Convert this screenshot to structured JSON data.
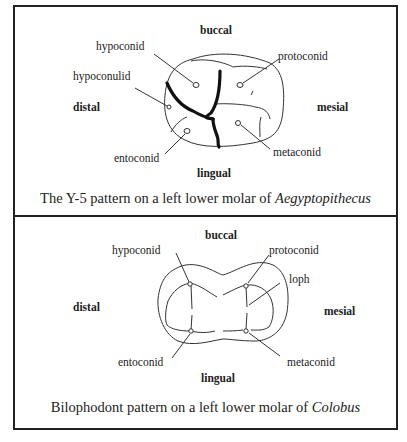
{
  "panels": [
    {
      "id": "y5",
      "directions": {
        "top": "buccal",
        "bottom": "lingual",
        "left": "distal",
        "right": "mesial"
      },
      "cusps": [
        "hypoconid",
        "protoconid",
        "hypoconulid",
        "entoconid",
        "metaconid"
      ],
      "caption": {
        "text": "The Y-5 pattern on a left lower molar of ",
        "genus": "Aegyptopithecus"
      }
    },
    {
      "id": "bilophodont",
      "directions": {
        "top": "buccal",
        "bottom": "lingual",
        "left": "distal",
        "right": "mesial"
      },
      "cusps": [
        "hypoconid",
        "protoconid",
        "loph",
        "entoconid",
        "metaconid"
      ],
      "caption": {
        "text": "Bilophodont pattern on a left lower molar of ",
        "genus": "Colobus"
      }
    }
  ]
}
